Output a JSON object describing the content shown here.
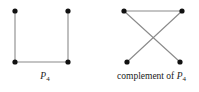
{
  "figure": {
    "background_color": "#ffffff",
    "edge_color": "#8a8a8a",
    "vertex_color": "#111111",
    "label_color": "#1a1a1a",
    "vertex_radius": 2.6,
    "edge_width": 1.1,
    "graphs": [
      {
        "id": "p4",
        "caption_prefix": "",
        "caption_symbol": "P",
        "caption_subscript": "4",
        "caption_text": "P4",
        "vertices": [
          {
            "name": "top-left",
            "x": 15,
            "y": 11
          },
          {
            "name": "top-right",
            "x": 68,
            "y": 11
          },
          {
            "name": "bottom-left",
            "x": 15,
            "y": 62
          },
          {
            "name": "bottom-right",
            "x": 68,
            "y": 62
          }
        ],
        "edges": [
          {
            "from": "top-left",
            "to": "bottom-left"
          },
          {
            "from": "bottom-left",
            "to": "bottom-right"
          },
          {
            "from": "bottom-right",
            "to": "top-right"
          }
        ]
      },
      {
        "id": "complement-p4",
        "caption_prefix": "complement of ",
        "caption_symbol": "P",
        "caption_subscript": "4",
        "caption_text": "complement of P4",
        "vertices": [
          {
            "name": "top-left",
            "x": 124,
            "y": 11
          },
          {
            "name": "top-right",
            "x": 182,
            "y": 11
          },
          {
            "name": "bottom-left",
            "x": 127,
            "y": 62
          },
          {
            "name": "bottom-right",
            "x": 180,
            "y": 62
          }
        ],
        "edges": [
          {
            "from": "top-left",
            "to": "top-right"
          },
          {
            "from": "top-left",
            "to": "bottom-right"
          },
          {
            "from": "top-right",
            "to": "bottom-left"
          }
        ]
      }
    ]
  },
  "captions": {
    "left": {
      "prefix": "",
      "symbol": "P",
      "subscript": "4"
    },
    "right": {
      "prefix": "complement of ",
      "symbol": "P",
      "subscript": "4"
    }
  }
}
